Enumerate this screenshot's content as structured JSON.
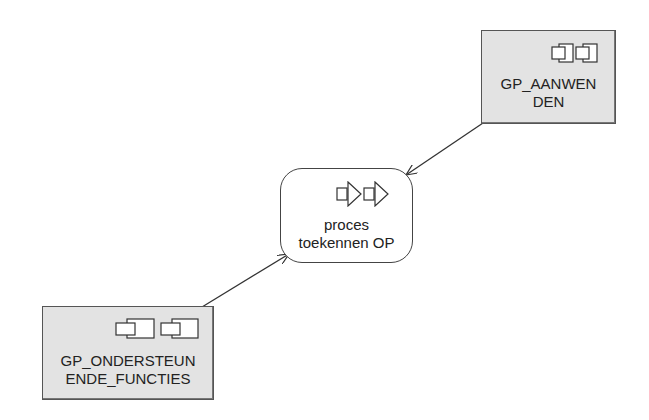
{
  "nodes": {
    "aanwenden": {
      "label_line1": "GP_AANWEN",
      "label_line2": "DEN",
      "type": "application-component",
      "icon": "component-icon",
      "fill": "#e3e3e3"
    },
    "proces": {
      "label_line1": "proces",
      "label_line2": "toekennen OP",
      "type": "business-process",
      "icon": "process-icon",
      "fill": "#ffffff"
    },
    "ondersteunende": {
      "label_line1": "GP_ONDERSTEUN",
      "label_line2": "ENDE_FUNCTIES",
      "type": "application-component",
      "icon": "component-icon",
      "fill": "#e3e3e3"
    }
  },
  "edges": [
    {
      "from": "aanwenden",
      "to": "proces",
      "style": "arrow"
    },
    {
      "from": "ondersteunende",
      "to": "proces",
      "style": "arrow"
    }
  ]
}
